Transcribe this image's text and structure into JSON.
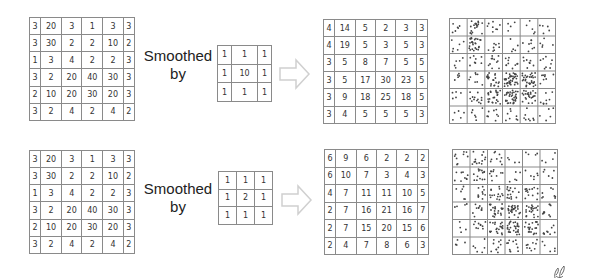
{
  "rows": [
    {
      "input": [
        [
          3,
          20,
          3,
          1,
          3,
          3
        ],
        [
          3,
          30,
          2,
          2,
          10,
          2
        ],
        [
          1,
          3,
          4,
          2,
          2,
          3
        ],
        [
          3,
          2,
          20,
          40,
          30,
          3
        ],
        [
          2,
          10,
          20,
          30,
          20,
          3
        ],
        [
          3,
          2,
          4,
          2,
          4,
          2
        ]
      ],
      "label_line1": "Smoothed",
      "label_line2": "by",
      "kernel": [
        [
          1,
          1,
          1
        ],
        [
          1,
          10,
          1
        ],
        [
          1,
          1,
          1
        ]
      ],
      "output": [
        [
          4,
          14,
          5,
          2,
          3,
          3
        ],
        [
          4,
          19,
          5,
          3,
          5,
          3
        ],
        [
          3,
          5,
          8,
          7,
          5,
          5
        ],
        [
          3,
          5,
          17,
          30,
          23,
          5
        ],
        [
          3,
          9,
          18,
          25,
          18,
          5
        ],
        [
          3,
          4,
          5,
          5,
          5,
          3
        ]
      ]
    },
    {
      "input": [
        [
          3,
          20,
          3,
          1,
          3,
          3
        ],
        [
          3,
          30,
          2,
          2,
          10,
          2
        ],
        [
          1,
          3,
          4,
          2,
          2,
          3
        ],
        [
          3,
          2,
          20,
          40,
          30,
          3
        ],
        [
          2,
          10,
          20,
          30,
          20,
          3
        ],
        [
          3,
          2,
          4,
          2,
          4,
          2
        ]
      ],
      "label_line1": "Smoothed",
      "label_line2": "by",
      "kernel": [
        [
          1,
          1,
          1
        ],
        [
          1,
          2,
          1
        ],
        [
          1,
          1,
          1
        ]
      ],
      "output": [
        [
          6,
          9,
          6,
          2,
          2,
          2
        ],
        [
          6,
          10,
          7,
          3,
          4,
          3
        ],
        [
          4,
          7,
          11,
          11,
          10,
          5
        ],
        [
          2,
          7,
          16,
          21,
          16,
          7
        ],
        [
          2,
          7,
          15,
          20,
          15,
          6
        ],
        [
          2,
          4,
          7,
          8,
          6,
          3
        ]
      ]
    }
  ],
  "icons": {
    "arrow": "hollow-right-arrow",
    "signature": "signature-mark"
  },
  "colors": {
    "grid_line": "#8a8a8a",
    "text": "#333333",
    "arrow": "#d0d0d0",
    "dot": "#444444"
  }
}
